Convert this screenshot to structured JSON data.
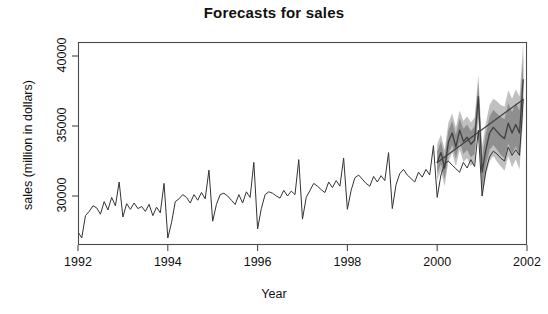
{
  "chart_data": {
    "type": "line",
    "title": "Forecasts for sales",
    "xlabel": "Year",
    "ylabel": "sales (million in dollars)",
    "grid": false,
    "legend": "none",
    "xlim": [
      1992.0,
      2002.0
    ],
    "ylim": [
      26500,
      41000
    ],
    "xticks": [
      1992,
      1994,
      1996,
      1998,
      2000,
      2002
    ],
    "xtick_labels": [
      "1992",
      "1994",
      "1996",
      "1998",
      "2000",
      "2002"
    ],
    "yticks": [
      30000,
      35000,
      40000
    ],
    "ytick_labels": [
      "30000",
      "35000",
      "40000"
    ],
    "colors": {
      "historical_line": "#333333",
      "forecast_line": "#404040",
      "interval_80": "#8f8f8f",
      "interval_95": "#c0c0c0",
      "axis": "#4a4a4a",
      "background": "#ffffff"
    },
    "series": [
      {
        "name": "Historical sales",
        "type": "line",
        "x_start": 1992.0,
        "x_step": 0.08333,
        "values": [
          27450,
          27000,
          28600,
          28900,
          29300,
          29150,
          28700,
          29600,
          29000,
          29900,
          29300,
          31000,
          28500,
          29450,
          29050,
          29500,
          29100,
          29250,
          28900,
          29400,
          28600,
          29200,
          28800,
          30900,
          27000,
          28100,
          29600,
          29800,
          30100,
          29900,
          29500,
          30100,
          29700,
          30250,
          29800,
          31850,
          28200,
          29400,
          30100,
          30200,
          30000,
          29700,
          29400,
          30100,
          29500,
          30300,
          29900,
          32400,
          27650,
          29100,
          30100,
          30300,
          30200,
          30000,
          29850,
          30400,
          30000,
          30350,
          30100,
          32600,
          28350,
          29900,
          30400,
          30900,
          30700,
          30450,
          30250,
          31000,
          30600,
          31100,
          30700,
          32700,
          29050,
          30400,
          31300,
          31500,
          31200,
          30900,
          30700,
          31400,
          31000,
          31450,
          31100,
          33100,
          29100,
          30800,
          31600,
          31900,
          31500,
          31250,
          31000,
          31700,
          31350,
          31900,
          31500,
          33600,
          29900,
          31500,
          32300,
          32500,
          32200,
          31950,
          31700,
          32400,
          32000,
          32600,
          32100,
          34700,
          30000,
          31800,
          32800,
          33200,
          33000,
          32700,
          32500,
          33500,
          32900,
          33300,
          32900,
          36900
        ],
        "n_points": 120,
        "x_end": 1999.92
      },
      {
        "name": "Point forecast",
        "type": "line",
        "x_start": 2000.0,
        "x_step": 0.08333,
        "values": [
          32400,
          33100,
          32000,
          33850,
          34500,
          33500,
          34700,
          33900,
          34200,
          33700,
          34000,
          37100,
          31700,
          33300,
          34500,
          34900,
          34600,
          34300,
          34100,
          35200,
          34500,
          35100,
          34500,
          38300
        ],
        "n_points": 24,
        "x_end": 2001.92
      },
      {
        "name": "80% prediction interval",
        "type": "band",
        "lower": [
          31600,
          32300,
          31200,
          33000,
          33650,
          32650,
          33850,
          33000,
          33300,
          32750,
          33000,
          36100,
          30600,
          32150,
          33300,
          33650,
          33300,
          32950,
          32700,
          33750,
          33000,
          33550,
          32900,
          36650
        ],
        "upper": [
          33200,
          33900,
          32800,
          34700,
          35350,
          34350,
          35550,
          34800,
          35100,
          34650,
          35000,
          38100,
          32800,
          34450,
          35700,
          36150,
          35900,
          35650,
          35500,
          36650,
          36000,
          36650,
          36100,
          39950
        ]
      },
      {
        "name": "95% prediction interval",
        "type": "band",
        "lower": [
          31100,
          31800,
          30700,
          32450,
          33100,
          32100,
          33300,
          32450,
          32700,
          32150,
          32400,
          35500,
          29850,
          31400,
          32500,
          32850,
          32450,
          32100,
          31800,
          32850,
          32050,
          32600,
          31900,
          35600
        ],
        "upper": [
          33700,
          34400,
          33300,
          35250,
          35900,
          34900,
          36100,
          35350,
          35700,
          35250,
          35600,
          38700,
          33550,
          35200,
          36500,
          36950,
          36750,
          36500,
          36400,
          37550,
          36950,
          37600,
          37100,
          41000
        ]
      }
    ]
  },
  "chart": {
    "title": "Forecasts for sales",
    "xlabel": "Year",
    "ylabel": "sales (million in dollars)"
  }
}
